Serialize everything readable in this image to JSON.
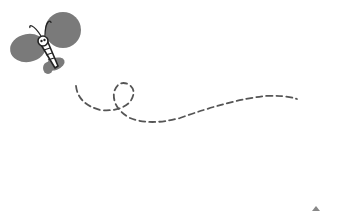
{
  "illustration": {
    "subject": "butterfly with dashed flight path",
    "colors": {
      "wing": "#7a7a7a",
      "outline": "#222222",
      "body_fill": "#ffffff",
      "path": "#555555",
      "background": "#ffffff"
    }
  }
}
